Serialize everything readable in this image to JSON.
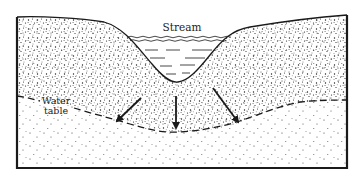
{
  "diagram": {
    "type": "cross-section",
    "labels": {
      "stream": "Stream",
      "water_table_line1": "Water",
      "water_table_line2": "table"
    },
    "arrows": [
      {
        "name": "left-seepage-arrow",
        "direction": "down-left"
      },
      {
        "name": "center-seepage-arrow",
        "direction": "down"
      },
      {
        "name": "right-seepage-arrow",
        "direction": "down-right"
      }
    ],
    "colors": {
      "ink": "#1a1a1a",
      "background": "#ffffff"
    }
  }
}
